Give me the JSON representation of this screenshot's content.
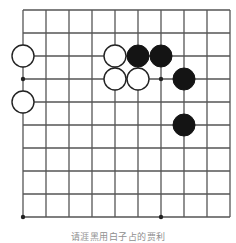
{
  "figure": {
    "caption": "请涯黑用白子占的贾利",
    "caption_note": "caption-clipped-at-bottom-edge"
  },
  "board": {
    "type": "go-board-fragment",
    "columns": 10,
    "rows": 10,
    "origin_x": 23,
    "origin_y": 10,
    "spacing": 23,
    "line_color": "#555555",
    "line_width": 1.3,
    "background_color": "#ffffff",
    "star_point_color": "#222222",
    "star_point_radius": 2.2,
    "star_points": [
      {
        "col": 0,
        "row": 3
      },
      {
        "col": 6,
        "row": 3
      },
      {
        "col": 0,
        "row": 9
      },
      {
        "col": 6,
        "row": 9
      }
    ]
  },
  "stones": {
    "radius": 11,
    "white_fill": "#ffffff",
    "white_stroke": "#222222",
    "white_stroke_width": 1.4,
    "black_fill": "#141414",
    "black_stroke": "#141414",
    "white_count": 5,
    "black_count": 4,
    "list": [
      {
        "color": "white",
        "col": 0,
        "row": 2,
        "label": "white-stone-a1"
      },
      {
        "color": "white",
        "col": 0,
        "row": 4,
        "label": "white-stone-a2"
      },
      {
        "color": "white",
        "col": 4,
        "row": 2,
        "label": "white-stone-b1"
      },
      {
        "color": "white",
        "col": 4,
        "row": 3,
        "label": "white-stone-b2"
      },
      {
        "color": "white",
        "col": 5,
        "row": 3,
        "label": "white-stone-b3"
      },
      {
        "color": "black",
        "col": 5,
        "row": 2,
        "label": "black-stone-c1"
      },
      {
        "color": "black",
        "col": 6,
        "row": 2,
        "label": "black-stone-c2"
      },
      {
        "color": "black",
        "col": 7,
        "row": 3,
        "label": "black-stone-c3"
      },
      {
        "color": "black",
        "col": 7,
        "row": 5,
        "label": "black-stone-c4"
      }
    ]
  }
}
